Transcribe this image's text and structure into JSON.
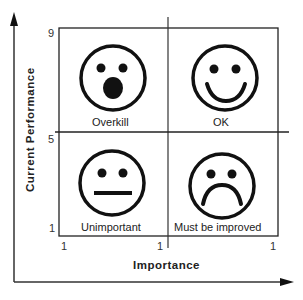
{
  "axes": {
    "x_title": "Importance",
    "y_title": "Current Performance",
    "x_ticks": [
      "1",
      "1",
      "1"
    ],
    "y_ticks": [
      "9",
      "5",
      "1"
    ]
  },
  "quadrants": [
    {
      "id": "top-left",
      "label": "Overkill",
      "face": "surprised-face"
    },
    {
      "id": "top-right",
      "label": "OK",
      "face": "happy-face"
    },
    {
      "id": "bottom-left",
      "label": "Unimportant",
      "face": "neutral-face"
    },
    {
      "id": "bottom-right",
      "label": "Must be improved",
      "face": "sad-face"
    }
  ],
  "colors": {
    "line": "#1a1a1a",
    "background": "#ffffff"
  }
}
